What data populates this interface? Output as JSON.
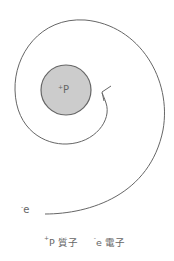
{
  "diagram": {
    "nucleus": {
      "charge": "+",
      "symbol": "P",
      "fill": "#cccccc",
      "stroke": "#666666"
    },
    "electron": {
      "charge": "-",
      "symbol": "e"
    },
    "legend": [
      {
        "charge": "+",
        "symbol": "P",
        "name": "質子"
      },
      {
        "charge": "-",
        "symbol": "e",
        "name": "電子"
      }
    ],
    "line_color": "#666666"
  }
}
